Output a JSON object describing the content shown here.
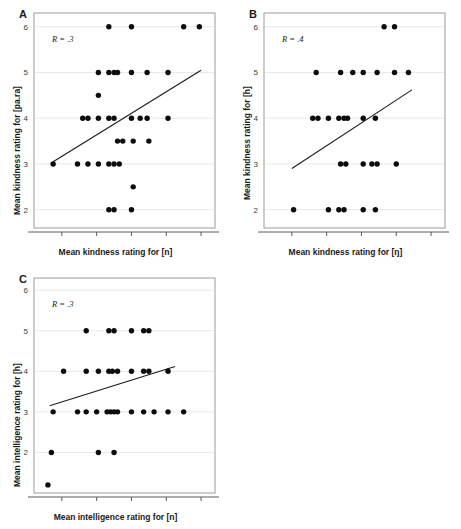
{
  "figure": {
    "background": "#ffffff",
    "dot_color": "#0d0d0d",
    "grid_color": "#e8e8e8",
    "frame_color": "#9a9a9a"
  },
  "chart_data": [
    {
      "id": "panel-a",
      "type": "scatter",
      "panel_letter": "A",
      "title": "",
      "annotation": "R = .3",
      "xlabel": "Mean kindness rating for [n]",
      "ylabel": "Mean kindness rating for [pa.ra]",
      "xlim": [
        1.2,
        6.4
      ],
      "ylim": [
        1.6,
        6.3
      ],
      "xticks": [
        2,
        3,
        4,
        5,
        6
      ],
      "yticks": [
        2,
        3,
        4,
        5,
        6
      ],
      "xticklabels": [
        "2",
        "3",
        "4",
        "5",
        "6"
      ],
      "yticklabels": [
        "2",
        "3",
        "4",
        "5",
        "6"
      ],
      "grid": true,
      "legend": "none",
      "points": [
        [
          3.35,
          6.0
        ],
        [
          4.0,
          6.0
        ],
        [
          5.5,
          6.0
        ],
        [
          5.95,
          6.0
        ],
        [
          3.05,
          5.0
        ],
        [
          3.35,
          5.0
        ],
        [
          3.5,
          5.0
        ],
        [
          3.6,
          5.0
        ],
        [
          4.0,
          5.0
        ],
        [
          4.45,
          5.0
        ],
        [
          5.05,
          5.0
        ],
        [
          3.05,
          4.5
        ],
        [
          2.6,
          4.0
        ],
        [
          2.75,
          4.0
        ],
        [
          3.05,
          4.0
        ],
        [
          3.35,
          4.0
        ],
        [
          3.5,
          4.0
        ],
        [
          4.0,
          4.0
        ],
        [
          4.25,
          4.0
        ],
        [
          4.45,
          4.0
        ],
        [
          5.05,
          4.0
        ],
        [
          3.6,
          3.5
        ],
        [
          3.75,
          3.5
        ],
        [
          4.05,
          3.5
        ],
        [
          4.5,
          3.5
        ],
        [
          1.75,
          3.0
        ],
        [
          2.45,
          3.0
        ],
        [
          2.75,
          3.0
        ],
        [
          3.05,
          3.0
        ],
        [
          3.35,
          3.0
        ],
        [
          3.5,
          3.0
        ],
        [
          3.65,
          3.0
        ],
        [
          4.05,
          2.5
        ],
        [
          3.35,
          2.0
        ],
        [
          3.5,
          2.0
        ],
        [
          4.0,
          2.0
        ]
      ],
      "fit_line": {
        "x0": 1.75,
        "y0": 3.05,
        "x1": 6.0,
        "y1": 5.05
      }
    },
    {
      "id": "panel-b",
      "type": "scatter",
      "panel_letter": "B",
      "title": "",
      "annotation": "R = .4",
      "xlabel": "Mean kindness rating for [ŋ]",
      "ylabel": "Mean kindness rating for [h]",
      "xlim": [
        1.2,
        6.4
      ],
      "ylim": [
        1.6,
        6.3
      ],
      "xticks": [
        2,
        3,
        4,
        5,
        6
      ],
      "yticks": [
        2,
        3,
        4,
        5,
        6
      ],
      "xticklabels": [
        "2",
        "3",
        "4",
        "5",
        "6"
      ],
      "yticklabels": [
        "2",
        "3",
        "4",
        "5",
        "6"
      ],
      "grid": true,
      "legend": "none",
      "points": [
        [
          4.65,
          6.0
        ],
        [
          4.95,
          6.0
        ],
        [
          2.7,
          5.0
        ],
        [
          3.4,
          5.0
        ],
        [
          3.75,
          5.0
        ],
        [
          4.05,
          5.0
        ],
        [
          4.45,
          5.0
        ],
        [
          4.95,
          5.0
        ],
        [
          5.35,
          5.0
        ],
        [
          2.6,
          4.0
        ],
        [
          2.75,
          4.0
        ],
        [
          3.05,
          4.0
        ],
        [
          3.35,
          4.0
        ],
        [
          3.5,
          4.0
        ],
        [
          3.6,
          4.0
        ],
        [
          4.05,
          4.0
        ],
        [
          4.4,
          4.0
        ],
        [
          3.4,
          3.0
        ],
        [
          3.55,
          3.0
        ],
        [
          4.05,
          3.0
        ],
        [
          4.3,
          3.0
        ],
        [
          4.45,
          3.0
        ],
        [
          5.0,
          3.0
        ],
        [
          2.05,
          2.0
        ],
        [
          3.05,
          2.0
        ],
        [
          3.35,
          2.0
        ],
        [
          3.5,
          2.0
        ],
        [
          4.05,
          2.0
        ],
        [
          4.4,
          2.0
        ]
      ],
      "fit_line": {
        "x0": 2.0,
        "y0": 2.9,
        "x1": 5.45,
        "y1": 4.62
      }
    },
    {
      "id": "panel-c",
      "type": "scatter",
      "panel_letter": "C",
      "title": "",
      "annotation": "R = .3",
      "xlabel": "Mean intelligence rating for [n]",
      "ylabel": "Mean intelligence rating for [h]",
      "xlim": [
        1.2,
        6.4
      ],
      "ylim": [
        1.0,
        6.3
      ],
      "xticks": [
        2,
        3,
        4,
        5,
        6
      ],
      "yticks": [
        2,
        3,
        4,
        5,
        6
      ],
      "xticklabels": [
        "2",
        "3",
        "4",
        "5",
        "6"
      ],
      "yticklabels": [
        "2",
        "3",
        "4",
        "5",
        "6"
      ],
      "grid": true,
      "legend": "none",
      "points": [
        [
          2.7,
          5.0
        ],
        [
          3.35,
          5.0
        ],
        [
          3.5,
          5.0
        ],
        [
          4.0,
          5.0
        ],
        [
          4.35,
          5.0
        ],
        [
          4.5,
          5.0
        ],
        [
          2.05,
          4.0
        ],
        [
          2.7,
          4.0
        ],
        [
          3.05,
          4.0
        ],
        [
          3.35,
          4.0
        ],
        [
          3.45,
          4.0
        ],
        [
          3.6,
          4.0
        ],
        [
          4.0,
          4.0
        ],
        [
          4.35,
          4.0
        ],
        [
          4.5,
          4.0
        ],
        [
          5.05,
          4.0
        ],
        [
          1.75,
          3.0
        ],
        [
          2.45,
          3.0
        ],
        [
          2.7,
          3.0
        ],
        [
          3.0,
          3.0
        ],
        [
          3.3,
          3.0
        ],
        [
          3.4,
          3.0
        ],
        [
          3.5,
          3.0
        ],
        [
          3.6,
          3.0
        ],
        [
          4.0,
          3.0
        ],
        [
          4.35,
          3.0
        ],
        [
          4.65,
          3.0
        ],
        [
          5.05,
          3.0
        ],
        [
          5.5,
          3.0
        ],
        [
          1.7,
          2.0
        ],
        [
          3.05,
          2.0
        ],
        [
          3.5,
          2.0
        ],
        [
          1.6,
          1.2
        ]
      ],
      "fit_line": {
        "x0": 1.65,
        "y0": 3.15,
        "x1": 5.25,
        "y1": 4.12
      }
    }
  ]
}
